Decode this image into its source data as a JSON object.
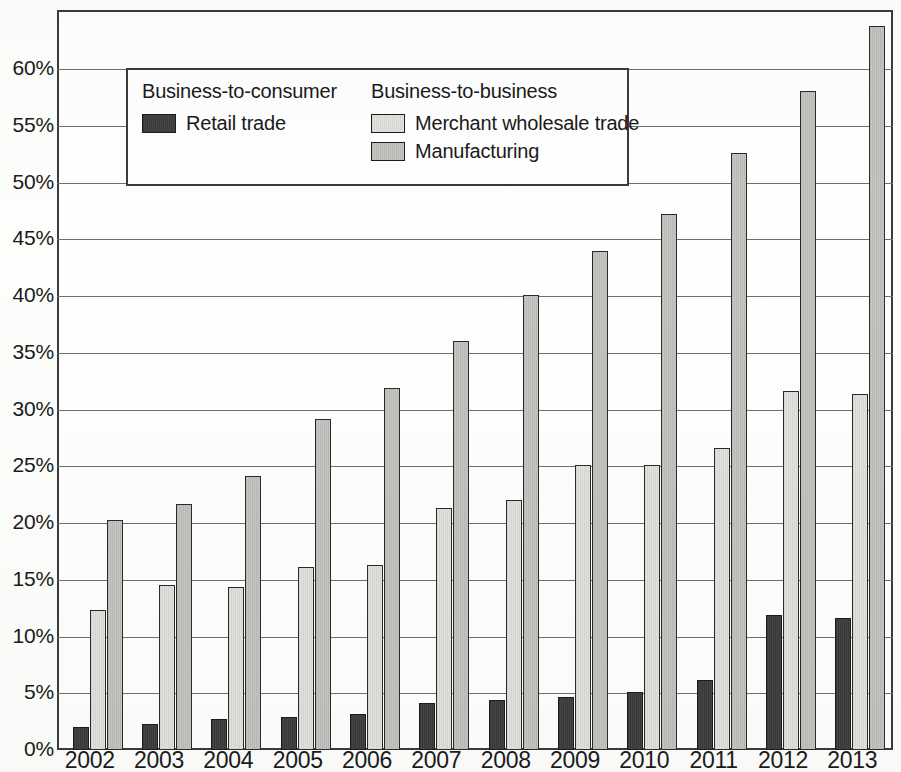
{
  "chart_data": {
    "type": "bar",
    "title": "",
    "xlabel": "",
    "ylabel": "",
    "ylim": [
      0,
      65
    ],
    "grid": true,
    "legend_position": "upper-left-inside",
    "categories": [
      "2002",
      "2003",
      "2004",
      "2005",
      "2006",
      "2007",
      "2008",
      "2009",
      "2010",
      "2011",
      "2012",
      "2013"
    ],
    "ytick_labels": [
      "0%",
      "5%",
      "10%",
      "15%",
      "20%",
      "25%",
      "30%",
      "35%",
      "40%",
      "45%",
      "50%",
      "55%",
      "60%"
    ],
    "ytick_values": [
      0,
      5,
      10,
      15,
      20,
      25,
      30,
      35,
      40,
      45,
      50,
      55,
      60
    ],
    "series": [
      {
        "name": "Retail trade",
        "group": "Business-to-consumer",
        "color": "#3d3d3d",
        "values": [
          2.0,
          2.3,
          2.7,
          2.9,
          3.2,
          4.1,
          4.4,
          4.7,
          5.1,
          6.2,
          11.9,
          11.6
        ]
      },
      {
        "name": "Merchant wholesale trade",
        "group": "Business-to-business",
        "color": "#dcdcd8",
        "values": [
          12.3,
          14.5,
          14.4,
          16.1,
          16.3,
          21.3,
          22.0,
          25.1,
          25.1,
          26.6,
          31.6,
          31.4
        ]
      },
      {
        "name": "Manufacturing",
        "group": "Business-to-business",
        "color": "#c0c0bc",
        "values": [
          20.3,
          21.7,
          24.1,
          29.2,
          31.9,
          36.0,
          40.1,
          44.0,
          47.2,
          52.6,
          58.1,
          63.8
        ]
      }
    ]
  },
  "legend": {
    "groups": [
      {
        "title": "Business-to-consumer",
        "entries": [
          {
            "label": "Retail trade",
            "swatch": "retail"
          }
        ]
      },
      {
        "title": "Business-to-business",
        "entries": [
          {
            "label": "Merchant wholesale trade",
            "swatch": "wholesale"
          },
          {
            "label": "Manufacturing",
            "swatch": "manufacturing"
          }
        ]
      }
    ]
  }
}
